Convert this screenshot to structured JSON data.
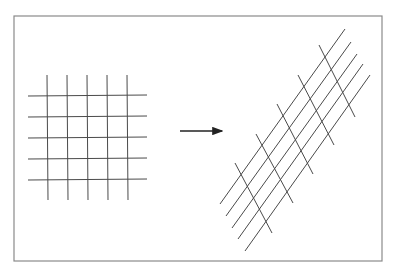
{
  "page": {
    "running_head": "",
    "running_head_visible": "clipped at top edge, illegible"
  },
  "figure": {
    "frame": {
      "x1": 14,
      "y1": 16,
      "x2": 382,
      "y2": 261,
      "stroke": "#8a8a8a"
    },
    "line_color": "#4a4a4a",
    "left_grid": {
      "vertical_lines": [
        {
          "x1": 47,
          "y1": 75,
          "x2": 48,
          "y2": 200
        },
        {
          "x1": 67,
          "y1": 75,
          "x2": 68,
          "y2": 200
        },
        {
          "x1": 87,
          "y1": 75,
          "x2": 88,
          "y2": 200
        },
        {
          "x1": 107,
          "y1": 75,
          "x2": 108,
          "y2": 200
        },
        {
          "x1": 127,
          "y1": 75,
          "x2": 128,
          "y2": 200
        }
      ],
      "horizontal_lines": [
        {
          "x1": 28,
          "y1": 96,
          "x2": 147,
          "y2": 95
        },
        {
          "x1": 28,
          "y1": 117,
          "x2": 147,
          "y2": 116
        },
        {
          "x1": 28,
          "y1": 138,
          "x2": 147,
          "y2": 137
        },
        {
          "x1": 28,
          "y1": 159,
          "x2": 147,
          "y2": 158
        },
        {
          "x1": 28,
          "y1": 180,
          "x2": 147,
          "y2": 179
        }
      ]
    },
    "arrow": {
      "x1": 180,
      "y1": 131,
      "x2": 222,
      "y2": 131
    },
    "right_grid": {
      "long_lines": [
        {
          "x1": 345,
          "y1": 29,
          "x2": 220,
          "y2": 204
        },
        {
          "x1": 351,
          "y1": 42,
          "x2": 226,
          "y2": 216
        },
        {
          "x1": 357,
          "y1": 54,
          "x2": 232,
          "y2": 228
        },
        {
          "x1": 363,
          "y1": 64,
          "x2": 238,
          "y2": 239
        },
        {
          "x1": 370,
          "y1": 75,
          "x2": 245,
          "y2": 251
        }
      ],
      "short_lines": [
        {
          "x1": 235,
          "y1": 163,
          "x2": 272,
          "y2": 233
        },
        {
          "x1": 256,
          "y1": 134,
          "x2": 293,
          "y2": 203
        },
        {
          "x1": 277,
          "y1": 104,
          "x2": 313,
          "y2": 174
        },
        {
          "x1": 298,
          "y1": 75,
          "x2": 334,
          "y2": 145
        },
        {
          "x1": 319,
          "y1": 45,
          "x2": 355,
          "y2": 117
        }
      ]
    }
  }
}
